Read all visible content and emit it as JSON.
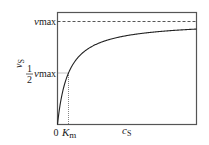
{
  "diagram": {
    "type": "michaelis-menten-curve",
    "y_axis_label": "v",
    "y_axis_subscript": "S",
    "x_axis_label": "c",
    "x_axis_subscript": "S",
    "vmax_label": "v",
    "vmax_subscript": "max",
    "half_vmax_fraction_num": "1",
    "half_vmax_fraction_den": "2",
    "half_vmax_label": "v",
    "half_vmax_subscript": "max",
    "origin_label": "0",
    "km_label": "K",
    "km_subscript": "m"
  },
  "chart_data": {
    "type": "line",
    "title": "",
    "xlabel": "c_S",
    "ylabel": "v_S",
    "x_ticks": [
      "0",
      "K_m"
    ],
    "y_ticks": [
      "1/2 v_max",
      "v_max"
    ],
    "equation": "v = v_max * c / (K_m + c)",
    "reference_lines": [
      {
        "name": "v_max asymptote",
        "style": "dashed",
        "orientation": "horizontal"
      },
      {
        "name": "1/2 v_max",
        "style": "dotted",
        "orientation": "horizontal"
      },
      {
        "name": "K_m",
        "style": "dotted",
        "orientation": "vertical"
      }
    ],
    "series": [
      {
        "name": "v_S",
        "x_relative_to_Km": [
          0,
          0.5,
          1,
          2,
          4,
          6,
          8,
          10,
          12.6
        ],
        "y_fraction_of_vmax": [
          0,
          0.333,
          0.5,
          0.667,
          0.8,
          0.857,
          0.889,
          0.909,
          0.927
        ]
      }
    ],
    "grid": false
  }
}
